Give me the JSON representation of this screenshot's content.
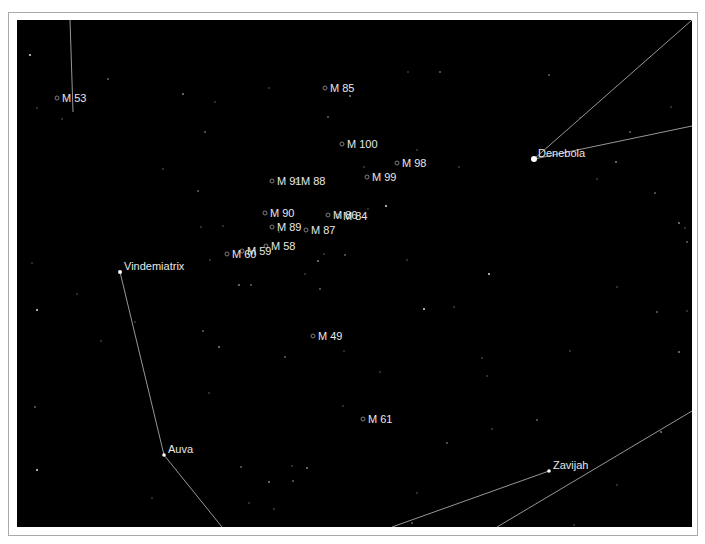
{
  "chart": {
    "background": "#000000",
    "line_color": "#bdbdbd",
    "label_color": "#e8e8e8"
  },
  "stars_named": [
    {
      "name": "Denebola",
      "x": 517,
      "y": 139,
      "r": 3
    },
    {
      "name": "Vindemiatrix",
      "x": 103,
      "y": 252,
      "r": 2
    },
    {
      "name": "Auva",
      "x": 147,
      "y": 435,
      "r": 1.8
    },
    {
      "name": "Zavijah",
      "x": 532,
      "y": 451,
      "r": 1.8
    }
  ],
  "messier": [
    {
      "name": "M 53",
      "x": 40,
      "y": 78
    },
    {
      "name": "M 85",
      "x": 308,
      "y": 68
    },
    {
      "name": "M 100",
      "x": 325,
      "y": 124
    },
    {
      "name": "M 98",
      "x": 380,
      "y": 143
    },
    {
      "name": "M 99",
      "x": 350,
      "y": 157
    },
    {
      "name": "M 91",
      "x": 255,
      "y": 161
    },
    {
      "name": "M 88",
      "x": 279,
      "y": 161
    },
    {
      "name": "M 90",
      "x": 248,
      "y": 193
    },
    {
      "name": "M 86",
      "x": 311,
      "y": 195
    },
    {
      "name": "M 84",
      "x": 321,
      "y": 196
    },
    {
      "name": "M 89",
      "x": 255,
      "y": 207
    },
    {
      "name": "M 87",
      "x": 289,
      "y": 210
    },
    {
      "name": "M 58",
      "x": 249,
      "y": 226
    },
    {
      "name": "M 59",
      "x": 225,
      "y": 231
    },
    {
      "name": "M 60",
      "x": 210,
      "y": 234
    },
    {
      "name": "M 49",
      "x": 296,
      "y": 316
    },
    {
      "name": "M 61",
      "x": 346,
      "y": 399
    }
  ],
  "constellation_lines": [
    {
      "x1": 53,
      "y1": 0,
      "x2": 56,
      "y2": 92
    },
    {
      "x1": 517,
      "y1": 139,
      "x2": 675,
      "y2": 0
    },
    {
      "x1": 517,
      "y1": 139,
      "x2": 675,
      "y2": 106
    },
    {
      "x1": 103,
      "y1": 252,
      "x2": 147,
      "y2": 435
    },
    {
      "x1": 147,
      "y1": 435,
      "x2": 205,
      "y2": 507
    },
    {
      "x1": 532,
      "y1": 451,
      "x2": 375,
      "y2": 507
    },
    {
      "x1": 675,
      "y1": 391,
      "x2": 480,
      "y2": 507
    }
  ],
  "field_stars": [
    [
      13,
      35
    ],
    [
      20,
      88
    ],
    [
      45,
      99
    ],
    [
      91,
      59
    ],
    [
      146,
      149
    ],
    [
      166,
      74
    ],
    [
      188,
      112
    ],
    [
      198,
      82
    ],
    [
      252,
      68
    ],
    [
      311,
      97
    ],
    [
      333,
      76
    ],
    [
      391,
      52
    ],
    [
      423,
      52
    ],
    [
      347,
      147
    ],
    [
      351,
      189
    ],
    [
      369,
      186
    ],
    [
      400,
      130
    ],
    [
      442,
      147
    ],
    [
      532,
      55
    ],
    [
      563,
      98
    ],
    [
      599,
      142
    ],
    [
      613,
      112
    ],
    [
      654,
      87
    ],
    [
      580,
      159
    ],
    [
      638,
      173
    ],
    [
      662,
      203
    ],
    [
      668,
      208
    ],
    [
      670,
      222
    ],
    [
      15,
      243
    ],
    [
      60,
      274
    ],
    [
      20,
      290
    ],
    [
      184,
      207
    ],
    [
      206,
      206
    ],
    [
      181,
      171
    ],
    [
      193,
      240
    ],
    [
      222,
      265
    ],
    [
      234,
      265
    ],
    [
      262,
      212
    ],
    [
      288,
      254
    ],
    [
      303,
      269
    ],
    [
      301,
      241
    ],
    [
      307,
      234
    ],
    [
      328,
      235
    ],
    [
      390,
      240
    ],
    [
      437,
      287
    ],
    [
      472,
      254
    ],
    [
      553,
      331
    ],
    [
      600,
      267
    ],
    [
      640,
      292
    ],
    [
      670,
      291
    ],
    [
      662,
      332
    ],
    [
      18,
      387
    ],
    [
      84,
      321
    ],
    [
      118,
      302
    ],
    [
      186,
      311
    ],
    [
      202,
      327
    ],
    [
      192,
      373
    ],
    [
      268,
      337
    ],
    [
      327,
      331
    ],
    [
      326,
      386
    ],
    [
      407,
      289
    ],
    [
      363,
      352
    ],
    [
      465,
      338
    ],
    [
      520,
      400
    ],
    [
      600,
      465
    ],
    [
      644,
      412
    ],
    [
      676,
      412
    ],
    [
      470,
      356
    ],
    [
      475,
      409
    ],
    [
      224,
      447
    ],
    [
      252,
      462
    ],
    [
      275,
      446
    ],
    [
      276,
      461
    ],
    [
      232,
      483
    ],
    [
      257,
      489
    ],
    [
      20,
      450
    ],
    [
      135,
      478
    ],
    [
      400,
      473
    ],
    [
      430,
      423
    ],
    [
      262,
      508
    ],
    [
      290,
      448
    ],
    [
      395,
      503
    ],
    [
      557,
      505
    ]
  ]
}
